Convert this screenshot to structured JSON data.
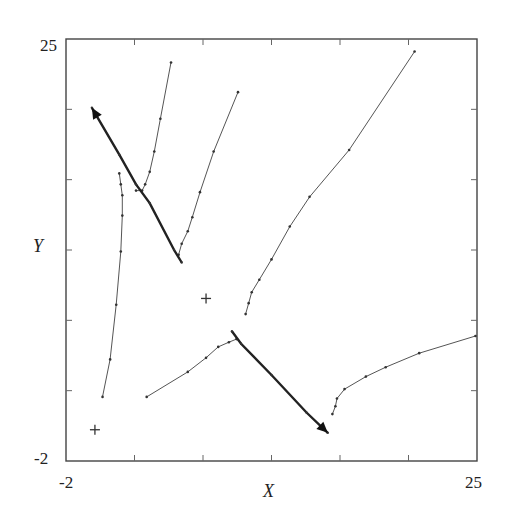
{
  "chart_data": {
    "type": "line",
    "title": "",
    "xlabel": "X",
    "ylabel": "Y",
    "xlim": [
      -2,
      25
    ],
    "ylim": [
      -2,
      25
    ],
    "x_tick_labels": [
      "-2",
      "25"
    ],
    "y_tick_labels": [
      "-2",
      "25"
    ],
    "minor_ticks_x": [
      2.5,
      7,
      11.5,
      16,
      20.5
    ],
    "minor_ticks_y": [
      2.5,
      7,
      11.5,
      16,
      20.5
    ],
    "grid": false,
    "legend": null,
    "markers_plus": [
      {
        "x": -0.1,
        "y": 0.0
      },
      {
        "x": 7.2,
        "y": 8.4
      }
    ],
    "thick_paths": [
      {
        "name": "upper-thick-trajectory",
        "arrow_at": "start",
        "points": [
          [
            -0.3,
            20.6
          ],
          [
            1.5,
            17.6
          ],
          [
            2.6,
            15.7
          ],
          [
            3.5,
            14.5
          ],
          [
            5.1,
            11.5
          ],
          [
            5.6,
            10.7
          ]
        ]
      },
      {
        "name": "lower-thick-trajectory",
        "arrow_at": "end",
        "points": [
          [
            8.9,
            6.3
          ],
          [
            9.5,
            5.5
          ],
          [
            11.5,
            3.5
          ],
          [
            13.8,
            1.1
          ],
          [
            15.2,
            -0.2
          ]
        ]
      }
    ],
    "series": [
      {
        "name": "curve-a",
        "points": [
          [
            4.9,
            23.5
          ],
          [
            4.2,
            19.9
          ],
          [
            3.8,
            17.8
          ],
          [
            3.5,
            16.5
          ],
          [
            3.2,
            15.7
          ],
          [
            3.0,
            15.3
          ],
          [
            2.6,
            15.3
          ]
        ]
      },
      {
        "name": "curve-b",
        "points": [
          [
            9.3,
            21.6
          ],
          [
            7.7,
            17.8
          ],
          [
            6.8,
            15.2
          ],
          [
            6.3,
            13.6
          ],
          [
            6.0,
            12.7
          ],
          [
            5.6,
            11.9
          ],
          [
            5.4,
            11.2
          ]
        ]
      },
      {
        "name": "curve-c",
        "points": [
          [
            0.4,
            2.1
          ],
          [
            0.9,
            4.5
          ],
          [
            1.3,
            8.0
          ],
          [
            1.6,
            11.4
          ],
          [
            1.7,
            13.7
          ],
          [
            1.7,
            15.0
          ],
          [
            1.6,
            15.7
          ],
          [
            1.5,
            16.4
          ]
        ]
      },
      {
        "name": "curve-d",
        "points": [
          [
            3.3,
            2.1
          ],
          [
            6.0,
            3.7
          ],
          [
            7.2,
            4.6
          ],
          [
            8.0,
            5.3
          ],
          [
            8.7,
            5.6
          ],
          [
            9.2,
            5.8
          ]
        ]
      },
      {
        "name": "curve-e",
        "points": [
          [
            20.9,
            24.2
          ],
          [
            16.6,
            17.9
          ],
          [
            14.0,
            14.9
          ],
          [
            12.7,
            13.0
          ],
          [
            11.5,
            10.9
          ],
          [
            10.7,
            9.6
          ],
          [
            10.2,
            8.8
          ],
          [
            10.0,
            8.1
          ],
          [
            9.8,
            7.4
          ]
        ]
      },
      {
        "name": "curve-f",
        "points": [
          [
            24.9,
            6.0
          ],
          [
            21.2,
            4.9
          ],
          [
            19.0,
            4.0
          ],
          [
            17.7,
            3.4
          ],
          [
            16.3,
            2.6
          ],
          [
            15.8,
            2.0
          ],
          [
            15.7,
            1.5
          ],
          [
            15.5,
            1.0
          ]
        ]
      }
    ]
  }
}
